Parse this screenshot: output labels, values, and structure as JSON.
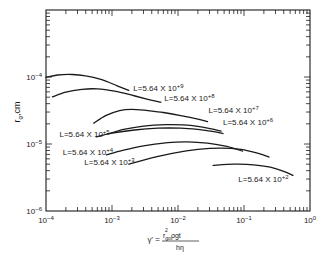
{
  "chart_data": {
    "type": "line",
    "title": "",
    "xlabel": "τ' = r_go² ρ g t / (h η)",
    "xlabel_parts": {
      "lhs": "γ' =",
      "numerator": "r",
      "numerator_sub": "go",
      "numerator_sup": "2",
      "numerator_rest": "ρgt",
      "denominator": "hη"
    },
    "ylabel": "r_g, cm",
    "ylabel_parts": {
      "main": "r",
      "sub": "g",
      "rest": ",cm"
    },
    "xscale": "log",
    "yscale": "log",
    "xlim": [
      0.0001,
      1
    ],
    "ylim": [
      1e-06,
      0.001
    ],
    "grid": false,
    "x_ticks": [
      {
        "value": 0.0001,
        "base": "10",
        "exp": "-4"
      },
      {
        "value": 0.001,
        "base": "10",
        "exp": "-3"
      },
      {
        "value": 0.01,
        "base": "10",
        "exp": "-2"
      },
      {
        "value": 0.1,
        "base": "10",
        "exp": "-1"
      },
      {
        "value": 1,
        "base": "10",
        "exp": "0"
      }
    ],
    "y_ticks": [
      {
        "value": 0.0001,
        "base": "10",
        "exp": "-4"
      },
      {
        "value": 1e-05,
        "base": "10",
        "exp": "-5"
      },
      {
        "value": 1e-06,
        "base": "10",
        "exp": "-6"
      }
    ],
    "series": [
      {
        "name": "L=5.64 X 10+9",
        "label_base": "L=5.64 X 10",
        "label_exp": "+9",
        "label_pos": [
          0.0021,
          6.2e-05
        ],
        "points": [
          [
            0.0001,
            9.85e-05
          ],
          [
            0.00015,
            0.000107
          ],
          [
            0.00025,
            0.000109
          ],
          [
            0.0004,
            0.000104
          ],
          [
            0.0007,
            9.1e-05
          ],
          [
            0.0012,
            7.4e-05
          ],
          [
            0.0018,
            6.3e-05
          ]
        ]
      },
      {
        "name": "L=5.64 X 10+8",
        "label_base": "L=5.64 X 10",
        "label_exp": "+8",
        "label_pos": [
          0.0062,
          4.4e-05
        ],
        "points": [
          [
            0.000125,
            5.05e-05
          ],
          [
            0.0002,
            5.95e-05
          ],
          [
            0.00035,
            6.55e-05
          ],
          [
            0.0006,
            6.65e-05
          ],
          [
            0.0011,
            6.15e-05
          ],
          [
            0.002,
            5.35e-05
          ],
          [
            0.0035,
            4.65e-05
          ],
          [
            0.0055,
            4.2e-05
          ]
        ]
      },
      {
        "name": "L=5.64 X 10+7",
        "label_base": "L=5.64 X 10",
        "label_exp": "+7",
        "label_pos": [
          0.029,
          2.9e-05
        ],
        "points": [
          [
            0.00053,
            2.05e-05
          ],
          [
            0.0008,
            2.65e-05
          ],
          [
            0.0013,
            3.15e-05
          ],
          [
            0.002,
            3.3e-05
          ],
          [
            0.0035,
            3.15e-05
          ],
          [
            0.006,
            2.95e-05
          ],
          [
            0.011,
            2.65e-05
          ],
          [
            0.02,
            2.35e-05
          ],
          [
            0.028,
            2.15e-05
          ]
        ]
      },
      {
        "name": "L=5.64 X 10+6",
        "label_base": "L=5.64 X 10",
        "label_exp": "+6",
        "label_pos": [
          0.048,
          1.95e-05
        ],
        "points": [
          [
            0.00085,
            1.4e-05
          ],
          [
            0.0015,
            1.65e-05
          ],
          [
            0.003,
            1.85e-05
          ],
          [
            0.0065,
            1.95e-05
          ],
          [
            0.012,
            1.93e-05
          ],
          [
            0.02,
            1.83e-05
          ],
          [
            0.032,
            1.68e-05
          ],
          [
            0.045,
            1.55e-05
          ]
        ]
      },
      {
        "name": "L=5.64 X 10+5",
        "label_base": "L=5.64 X 10",
        "label_exp": "+5",
        "label_pos": [
          0.00016,
          1.28e-05
        ],
        "points": [
          [
            0.00058,
            1.28e-05
          ],
          [
            0.001,
            1.45e-05
          ],
          [
            0.0022,
            1.62e-05
          ],
          [
            0.005,
            1.72e-05
          ],
          [
            0.011,
            1.72e-05
          ],
          [
            0.02,
            1.65e-05
          ],
          [
            0.033,
            1.54e-05
          ],
          [
            0.048,
            1.43e-05
          ]
        ]
      },
      {
        "name": "L=5.64 X 10+4",
        "label_base": "L=5.64 X 10",
        "label_exp": "+4",
        "label_pos": [
          0.00018,
          6.8e-06
        ],
        "points": [
          [
            0.00082,
            6.9e-06
          ],
          [
            0.0015,
            8.1e-06
          ],
          [
            0.003,
            9.4e-06
          ],
          [
            0.007,
            1.05e-05
          ],
          [
            0.014,
            1.08e-05
          ],
          [
            0.028,
            1.03e-05
          ],
          [
            0.055,
            9.2e-06
          ],
          [
            0.095,
            7.8e-06
          ]
        ]
      },
      {
        "name": "L=5.64 X 10+3",
        "label_base": "L=5.64 X 10",
        "label_exp": "+3",
        "label_pos": [
          0.00038,
          4.8e-06
        ],
        "points": [
          [
            0.0018,
            5e-06
          ],
          [
            0.004,
            6.2e-06
          ],
          [
            0.009,
            7.4e-06
          ],
          [
            0.02,
            8.3e-06
          ],
          [
            0.045,
            8.7e-06
          ],
          [
            0.09,
            8.3e-06
          ],
          [
            0.16,
            7.3e-06
          ],
          [
            0.24,
            6.4e-06
          ]
        ]
      },
      {
        "name": "L=5.64 X 10+2",
        "label_base": "L=5.64 X 10",
        "label_exp": "+2",
        "label_pos": [
          0.082,
          2.7e-06
        ],
        "points": [
          [
            0.034,
            4.8e-06
          ],
          [
            0.07,
            5e-06
          ],
          [
            0.14,
            4.9e-06
          ],
          [
            0.25,
            4.5e-06
          ],
          [
            0.4,
            3.9e-06
          ],
          [
            0.55,
            3.4e-06
          ]
        ]
      }
    ]
  }
}
